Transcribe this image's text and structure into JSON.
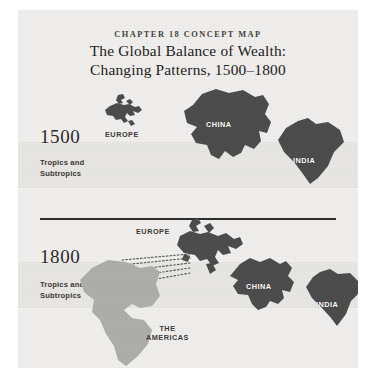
{
  "figure": {
    "eyebrow": "CHAPTER 18 CONCEPT MAP",
    "title_line1": "The Global Balance of Wealth:",
    "title_line2": "Changing Patterns, 1500–1800",
    "colors": {
      "page": "#ffffff",
      "panel_background": "#efeeec",
      "tropics_band": "#e7e6e3",
      "landmass_dark": "#4d4c4c",
      "landmass_light": "#adada9",
      "divider": "#2e2d2b",
      "title_text": "#232220",
      "label_text": "#ffffff"
    }
  },
  "panels": [
    {
      "year": "1500",
      "band_label_line1": "Tropics and",
      "band_label_line2": "Subtropics",
      "regions": [
        {
          "name": "EUROPE",
          "label_position": "below",
          "relative_size": "small",
          "fill": "dark"
        },
        {
          "name": "CHINA",
          "label_position": "inside",
          "relative_size": "large",
          "fill": "dark"
        },
        {
          "name": "INDIA",
          "label_position": "inside",
          "relative_size": "medium",
          "fill": "dark"
        }
      ]
    },
    {
      "year": "1800",
      "band_label_line1": "Tropics and",
      "band_label_line2": "Subtropics",
      "regions": [
        {
          "name": "EUROPE",
          "label_position": "left",
          "relative_size": "large",
          "fill": "dark"
        },
        {
          "name": "THE\nAMERICAS",
          "label_line1": "THE",
          "label_line2": "AMERICAS",
          "label_position": "right",
          "relative_size": "large",
          "fill": "light"
        },
        {
          "name": "CHINA",
          "label_position": "inside",
          "relative_size": "medium",
          "fill": "dark"
        },
        {
          "name": "INDIA",
          "label_position": "inside",
          "relative_size": "medium",
          "fill": "dark"
        }
      ],
      "flow_arrows": {
        "from": "EUROPE",
        "to": "THE AMERICAS",
        "style": "dotted",
        "count": 5
      }
    }
  ]
}
